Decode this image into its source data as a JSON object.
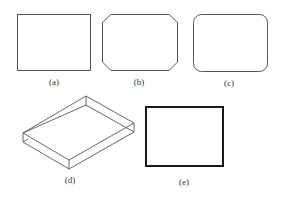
{
  "figure": {
    "panels": [
      {
        "id": "a",
        "label": "(a)",
        "shape": "rectangle",
        "label_x": 54,
        "label_y": 77
      },
      {
        "id": "b",
        "label": "(b)",
        "shape": "chamfered-rectangle",
        "label_x": 139,
        "label_y": 77
      },
      {
        "id": "c",
        "label": "(c)",
        "shape": "rounded-rectangle",
        "label_x": 229,
        "label_y": 78
      },
      {
        "id": "d",
        "label": "(d)",
        "shape": "3d-box",
        "label_x": 70,
        "label_y": 175
      },
      {
        "id": "e",
        "label": "(e)",
        "shape": "thick-rectangle",
        "label_x": 184,
        "label_y": 177
      }
    ],
    "colors": {
      "stroke": "#555555",
      "thick_stroke": "#1a1a1a",
      "background": "#ffffff"
    }
  }
}
